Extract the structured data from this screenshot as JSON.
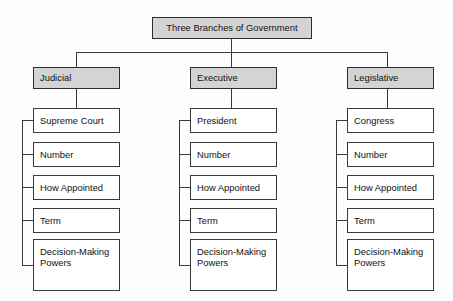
{
  "diagram": {
    "title": "Three Branches of Government",
    "branches": [
      {
        "name": "Judicial",
        "rows": [
          "Supreme Court",
          "Number",
          "How Appointed",
          "Term",
          "Decision-Making\nPowers"
        ]
      },
      {
        "name": "Executive",
        "rows": [
          "President",
          "Number",
          "How Appointed",
          "Term",
          "Decision-Making\nPowers"
        ]
      },
      {
        "name": "Legislative",
        "rows": [
          "Congress",
          "Number",
          "How Appointed",
          "Term",
          "Decision-Making\nPowers"
        ]
      }
    ],
    "colors": {
      "header_fill": "#d4d4d4",
      "box_fill": "#ffffff",
      "stroke": "#3a3a3a",
      "text": "#111111",
      "background": "#fdfdfd"
    }
  }
}
